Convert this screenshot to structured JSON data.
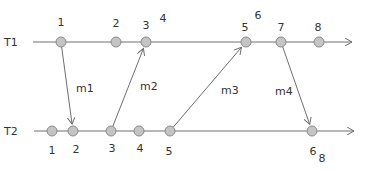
{
  "colors": {
    "line": "#6e6e6e",
    "dot_fill": "#c4c4c4",
    "dot_stroke": "#8a8a8a",
    "text": "#333333",
    "background": "#ffffff"
  },
  "processes": [
    {
      "name": "T1",
      "y": 42,
      "x_start": 33,
      "x_end": 352,
      "events": [
        {
          "label": "1",
          "x": 61
        },
        {
          "label": "2",
          "x": 116
        },
        {
          "label": "3",
          "x": 146
        },
        {
          "label": "5",
          "x": 246
        },
        {
          "label": "7",
          "x": 281
        },
        {
          "label": "8",
          "x": 319
        }
      ],
      "event_labels": [
        {
          "text": "1",
          "x": 61,
          "y": 26
        },
        {
          "text": "2",
          "x": 116,
          "y": 27
        },
        {
          "text": "3",
          "x": 146,
          "y": 29
        },
        {
          "text": "4",
          "x": 163,
          "y": 22
        },
        {
          "text": "5",
          "x": 245,
          "y": 31
        },
        {
          "text": "6",
          "x": 258,
          "y": 19
        },
        {
          "text": "7",
          "x": 281,
          "y": 31
        },
        {
          "text": "8",
          "x": 318,
          "y": 31
        }
      ]
    },
    {
      "name": "T2",
      "y": 131,
      "x_start": 34,
      "x_end": 354,
      "events": [
        {
          "label": "1",
          "x": 52
        },
        {
          "label": "2",
          "x": 73
        },
        {
          "label": "3",
          "x": 111
        },
        {
          "label": "4",
          "x": 139
        },
        {
          "label": "5",
          "x": 170
        },
        {
          "label": "8",
          "x": 312
        }
      ],
      "event_labels": [
        {
          "text": "1",
          "x": 52,
          "y": 154
        },
        {
          "text": "2",
          "x": 76,
          "y": 153
        },
        {
          "text": "3",
          "x": 112,
          "y": 152
        },
        {
          "text": "4",
          "x": 140,
          "y": 152
        },
        {
          "text": "5",
          "x": 169,
          "y": 155
        },
        {
          "text": "6",
          "x": 313,
          "y": 155
        },
        {
          "text": "8",
          "x": 322,
          "y": 162
        }
      ]
    }
  ],
  "messages": [
    {
      "label": "m1",
      "from": {
        "x": 61,
        "y": 42
      },
      "to": {
        "x": 73,
        "y": 131
      },
      "label_x": 76,
      "label_y": 92
    },
    {
      "label": "m2",
      "from": {
        "x": 111,
        "y": 131
      },
      "to": {
        "x": 146,
        "y": 42
      },
      "label_x": 140,
      "label_y": 90
    },
    {
      "label": "m3",
      "from": {
        "x": 170,
        "y": 131
      },
      "to": {
        "x": 246,
        "y": 42
      },
      "label_x": 221,
      "label_y": 94
    },
    {
      "label": "m4",
      "from": {
        "x": 281,
        "y": 42
      },
      "to": {
        "x": 312,
        "y": 131
      },
      "label_x": 275,
      "label_y": 95
    }
  ],
  "labels": {
    "t1": "T1",
    "t2": "T2"
  }
}
